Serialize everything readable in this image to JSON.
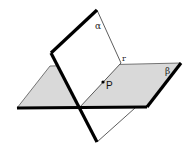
{
  "diagram": {
    "colors": {
      "plane_beta_fill": "#d9d9d9",
      "plane_alpha_fill": "#ffffff",
      "stroke": "#000000",
      "thin_stroke": "#333333"
    },
    "labels": {
      "alpha": "α",
      "beta": "β",
      "r": "r",
      "p": "P"
    },
    "planes": [
      {
        "name": "alpha",
        "label": "α",
        "orientation": "vertical"
      },
      {
        "name": "beta",
        "label": "β",
        "orientation": "horizontal",
        "shaded": true
      }
    ],
    "line": {
      "name": "r",
      "label": "r",
      "description": "intersection of α and β"
    },
    "point": {
      "name": "P",
      "label": "P",
      "on_line": "r"
    }
  }
}
